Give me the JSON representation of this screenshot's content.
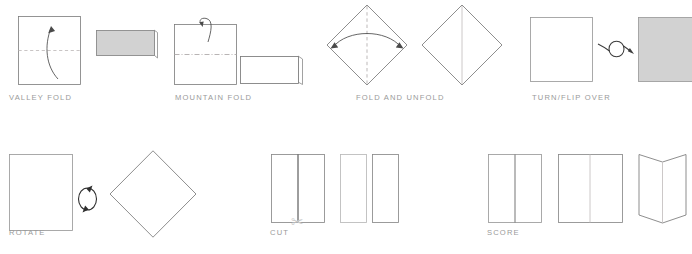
{
  "page": {
    "background_color": "#ffffff",
    "width": 692,
    "height": 254
  },
  "style": {
    "stroke_color": "#6e6e6e",
    "light_stroke_color": "#b9b9b9",
    "crease_color": "#c0bcbc",
    "fill_white": "#ffffff",
    "fill_gray": "#d2d2d2",
    "caption_color": "#9a9a9a",
    "arrow_color": "#3c3c3c"
  },
  "symbols": [
    {
      "id": "valley-fold",
      "label": "VALLEY FOLD",
      "row": 1,
      "crease_style": "dashed",
      "crease_orientation": "horizontal",
      "arrow": "curved-up-single",
      "result_shape": "gray-rectangle-with-flap",
      "result_fill": "#d2d2d2"
    },
    {
      "id": "mountain-fold",
      "label": "MOUNTAIN FOLD",
      "row": 1,
      "crease_style": "dash-dot",
      "crease_orientation": "horizontal",
      "arrow": "hooked-over-top",
      "result_shape": "white-rectangle-with-flap",
      "result_fill": "#ffffff"
    },
    {
      "id": "fold-and-unfold",
      "label": "FOLD AND UNFOLD",
      "row": 1,
      "crease_style": "dashed",
      "crease_orientation": "vertical",
      "arrow": "double-headed-arc",
      "result_shape": "diamond-with-crease",
      "result_fill": "#ffffff"
    },
    {
      "id": "turn-flip-over",
      "label": "TURN/FLIP OVER",
      "row": 1,
      "crease_style": "none",
      "arrow": "loop-right",
      "result_shape": "gray-square",
      "result_fill": "#d2d2d2"
    },
    {
      "id": "rotate",
      "label": "ROTATE",
      "row": 2,
      "crease_style": "none",
      "arrow": "circular-two-headed",
      "result_shape": "rotated-diamond",
      "result_fill": "#ffffff"
    },
    {
      "id": "cut",
      "label": "CUT",
      "row": 2,
      "crease_style": "solid-dark",
      "crease_orientation": "vertical",
      "icon": "scissors-icon",
      "icon_glyph": "✂",
      "result_shape": "two-separated-rectangles",
      "result_fill": "#ffffff"
    },
    {
      "id": "score",
      "label": "SCORE",
      "row": 2,
      "crease_style": "solid-light",
      "crease_orientation": "vertical",
      "result_shape": "v-folded-panel",
      "result_fill": "#ffffff"
    }
  ]
}
